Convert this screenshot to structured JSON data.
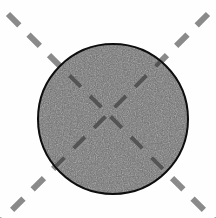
{
  "figure": {
    "title": "Circular specimen with dashed cross-hair axes",
    "canvas": {
      "width": 216,
      "height": 218,
      "background_color": "#fefefe"
    },
    "circle": {
      "label": "gray textured disc",
      "center_x": 113,
      "center_y": 119,
      "radius": 75,
      "fill_color": "#6e6e6e",
      "stroke_color": "#0d0d0d",
      "stroke_width": 2,
      "texture": "speckled noise"
    },
    "axes": [
      {
        "name": "diagonal-axis-nwse",
        "angle_degrees": 45,
        "orientation": "northwest-southeast",
        "dash_color_outside": "#8a8a8a",
        "dash_color_inside": "#4a4a4a",
        "dash_length": 16,
        "dash_gap": 13,
        "line_width": 6
      },
      {
        "name": "diagonal-axis-nesw",
        "angle_degrees": -45,
        "orientation": "northeast-southwest",
        "dash_color_outside": "#8a8a8a",
        "dash_color_inside": "#4a4a4a",
        "dash_length": 16,
        "dash_gap": 13,
        "line_width": 6
      }
    ],
    "corner_marks": [
      {
        "name": "corner-mark-top-left",
        "position": "top-left",
        "dash_count": 2
      },
      {
        "name": "corner-mark-top-right",
        "position": "top-right",
        "dash_count": 2
      },
      {
        "name": "corner-mark-bottom-left",
        "position": "bottom-left",
        "dash_count": 2
      },
      {
        "name": "corner-mark-bottom-right",
        "position": "bottom-right",
        "dash_count": 2
      }
    ]
  }
}
